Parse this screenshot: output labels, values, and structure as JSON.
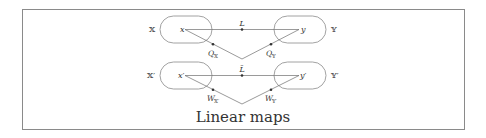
{
  "diagram": {
    "caption": "Linear maps",
    "colors": {
      "frame": "#8a8a8a",
      "stroke": "#7a7a7a",
      "text": "#333333"
    },
    "top_row": {
      "left_set": "𝕏",
      "right_set": "𝕐",
      "left_point": "x",
      "right_point": "y",
      "map_label": "L",
      "left_proj": "Q",
      "left_proj_sub": "𝕏",
      "right_proj": "Q",
      "right_proj_sub": "𝕐"
    },
    "bottom_row": {
      "left_set": "𝕏′",
      "right_set": "𝕐′",
      "left_point": "x′",
      "right_point": "y′",
      "map_label": "L̃",
      "left_proj": "W",
      "left_proj_sub": "𝕏′",
      "right_proj": "W",
      "right_proj_sub": "𝕐′"
    }
  }
}
